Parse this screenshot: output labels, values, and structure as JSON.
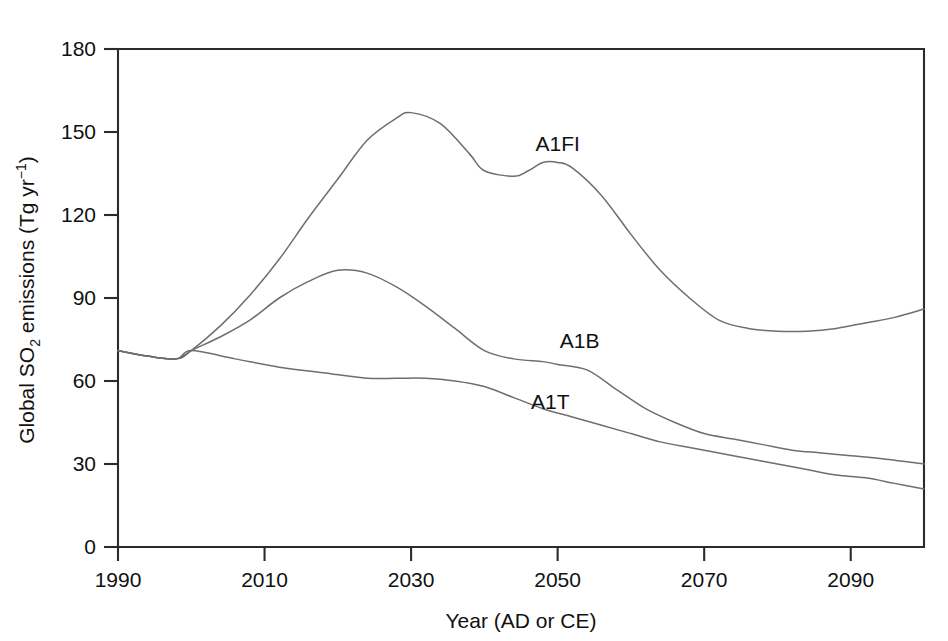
{
  "chart_data": {
    "type": "line",
    "title": "",
    "xlabel": "Year (AD or CE)",
    "ylabel": "Global SO2 emissions (Tg yr-1)",
    "ylabel_parts": {
      "prefix": "Global SO",
      "sub": "2",
      "middle": " emissions (Tg yr",
      "sup": "−1",
      "suffix": ")"
    },
    "xlim": [
      1990,
      2100
    ],
    "ylim": [
      0,
      180
    ],
    "xticks": [
      1990,
      2010,
      2030,
      2050,
      2070,
      2090
    ],
    "xtick_labels": [
      "1990",
      "2010",
      "2030",
      "2050",
      "2070",
      "2090"
    ],
    "yticks": [
      0,
      30,
      60,
      90,
      120,
      150,
      180
    ],
    "ytick_labels": [
      "0",
      "30",
      "60",
      "90",
      "120",
      "150",
      "180"
    ],
    "grid": false,
    "legend_position": "inline-annotations",
    "line_color": "#6e6e6e",
    "axis_color": "#2b2b2b",
    "series": [
      {
        "name": "A1FI",
        "label_x": 2050,
        "label_y": 143,
        "x": [
          1990,
          1994,
          1998,
          2000,
          2004,
          2008,
          2012,
          2016,
          2020,
          2024,
          2028,
          2030,
          2034,
          2038,
          2040,
          2044,
          2046,
          2048,
          2050,
          2052,
          2056,
          2060,
          2064,
          2068,
          2072,
          2076,
          2080,
          2084,
          2088,
          2092,
          2096,
          2100
        ],
        "y": [
          71,
          69,
          68,
          71,
          80,
          91,
          104,
          119,
          133,
          147,
          155,
          157,
          153,
          142,
          136,
          134,
          136,
          139,
          139,
          137,
          127,
          113,
          100,
          90,
          82,
          79,
          78,
          78,
          79,
          81,
          83,
          86
        ]
      },
      {
        "name": "A1B",
        "label_x": 2053,
        "label_y": 72,
        "x": [
          1990,
          1994,
          1998,
          2000,
          2004,
          2008,
          2012,
          2016,
          2020,
          2024,
          2028,
          2032,
          2036,
          2040,
          2044,
          2048,
          2050,
          2054,
          2058,
          2062,
          2066,
          2070,
          2074,
          2078,
          2082,
          2086,
          2090,
          2094,
          2100
        ],
        "y": [
          71,
          69,
          68,
          71,
          76,
          82,
          90,
          96,
          100,
          99,
          94,
          87,
          79,
          71,
          68,
          67,
          66,
          64,
          57,
          50,
          45,
          41,
          39,
          37,
          35,
          34,
          33,
          32,
          30
        ]
      },
      {
        "name": "A1T",
        "label_x": 2049,
        "label_y": 50,
        "x": [
          1990,
          1994,
          1998,
          2000,
          2006,
          2012,
          2018,
          2024,
          2028,
          2032,
          2036,
          2040,
          2044,
          2048,
          2052,
          2056,
          2060,
          2064,
          2068,
          2072,
          2076,
          2080,
          2084,
          2088,
          2092,
          2096,
          2100
        ],
        "y": [
          71,
          69,
          68,
          71,
          68,
          65,
          63,
          61,
          61,
          61,
          60,
          58,
          54,
          50,
          47,
          44,
          41,
          38,
          36,
          34,
          32,
          30,
          28,
          26,
          25,
          23,
          21
        ]
      }
    ]
  }
}
